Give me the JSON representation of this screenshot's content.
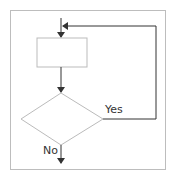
{
  "diagram": {
    "type": "flowchart-loop",
    "nodes": [
      {
        "id": "process",
        "shape": "rectangle",
        "label": ""
      },
      {
        "id": "decision",
        "shape": "diamond",
        "label": ""
      }
    ],
    "edges": [
      {
        "from": "entry",
        "to": "process",
        "label": ""
      },
      {
        "from": "process",
        "to": "decision",
        "label": ""
      },
      {
        "from": "decision",
        "to": "process",
        "label": "Yes"
      },
      {
        "from": "decision",
        "to": "exit",
        "label": "No"
      }
    ],
    "labels": {
      "yes": "Yes",
      "no": "No"
    },
    "colors": {
      "line": "#333333",
      "shape_border": "#bbbbbb",
      "frame": "#bdbdbd"
    }
  }
}
